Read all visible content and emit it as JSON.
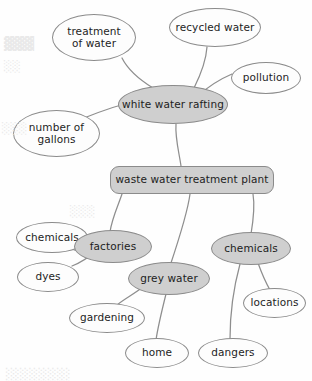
{
  "diagram": {
    "type": "concept-map",
    "canvas": {
      "width": 312,
      "height": 381
    },
    "colors": {
      "node_fill_highlight": "#cfcfcf",
      "node_fill_plain": "#fdfdfd",
      "node_stroke": "#8b8b8b",
      "edge_stroke": "#8e8e8e",
      "text": "#1d1d1d",
      "background": "#fefefe"
    },
    "nodes": [
      {
        "id": "treatment-of-water",
        "label": "treatment\nof water",
        "shape": "ellipse",
        "fill": "plain",
        "x": 52,
        "y": 14,
        "w": 84,
        "h": 47,
        "font_size": 10.5
      },
      {
        "id": "recycled-water",
        "label": "recycled water",
        "shape": "ellipse",
        "fill": "plain",
        "x": 169,
        "y": 8,
        "w": 92,
        "h": 39,
        "font_size": 10.5
      },
      {
        "id": "pollution",
        "label": "pollution",
        "shape": "ellipse",
        "fill": "plain",
        "x": 231,
        "y": 62,
        "w": 70,
        "h": 32,
        "font_size": 10.5
      },
      {
        "id": "white-water-rafting",
        "label": "white water rafting",
        "shape": "ellipse",
        "fill": "highlight",
        "x": 118,
        "y": 85,
        "w": 110,
        "h": 39,
        "font_size": 10.5
      },
      {
        "id": "number-of-gallons",
        "label": "number of\ngallons",
        "shape": "ellipse",
        "fill": "plain",
        "x": 13,
        "y": 110,
        "w": 87,
        "h": 47,
        "font_size": 10.5
      },
      {
        "id": "waste-water-treatment-plant",
        "label": "waste water treatment plant",
        "shape": "rounded",
        "fill": "highlight",
        "x": 110,
        "y": 166,
        "w": 164,
        "h": 28,
        "font_size": 10.5
      },
      {
        "id": "chemicals-left",
        "label": "chemicals",
        "shape": "ellipse",
        "fill": "plain",
        "x": 16,
        "y": 222,
        "w": 72,
        "h": 31,
        "font_size": 10.5
      },
      {
        "id": "factories",
        "label": "factories",
        "shape": "ellipse",
        "fill": "highlight",
        "x": 74,
        "y": 230,
        "w": 78,
        "h": 33,
        "font_size": 10.5
      },
      {
        "id": "chemicals-right",
        "label": "chemicals",
        "shape": "ellipse",
        "fill": "highlight",
        "x": 211,
        "y": 232,
        "w": 80,
        "h": 33,
        "font_size": 10.5
      },
      {
        "id": "dyes",
        "label": "dyes",
        "shape": "ellipse",
        "fill": "plain",
        "x": 17,
        "y": 262,
        "w": 62,
        "h": 30,
        "font_size": 10.5
      },
      {
        "id": "grey-water",
        "label": "grey water",
        "shape": "ellipse",
        "fill": "highlight",
        "x": 128,
        "y": 262,
        "w": 82,
        "h": 33,
        "font_size": 10.5
      },
      {
        "id": "locations",
        "label": "locations",
        "shape": "ellipse",
        "fill": "plain",
        "x": 243,
        "y": 288,
        "w": 63,
        "h": 30,
        "font_size": 10.5
      },
      {
        "id": "gardening",
        "label": "gardening",
        "shape": "ellipse",
        "fill": "plain",
        "x": 69,
        "y": 303,
        "w": 76,
        "h": 30,
        "font_size": 10.5
      },
      {
        "id": "home",
        "label": "home",
        "shape": "ellipse",
        "fill": "plain",
        "x": 125,
        "y": 338,
        "w": 64,
        "h": 30,
        "font_size": 10.5
      },
      {
        "id": "dangers",
        "label": "dangers",
        "shape": "ellipse",
        "fill": "plain",
        "x": 198,
        "y": 338,
        "w": 70,
        "h": 30,
        "font_size": 10.5
      }
    ],
    "edges": [
      {
        "id": "edge-treatment-to-rafting",
        "from": "treatment-of-water",
        "to": "white-water-rafting",
        "path": "M122,58 C128,70 140,80 153,88"
      },
      {
        "id": "edge-recycled-to-rafting",
        "from": "recycled-water",
        "to": "white-water-rafting",
        "path": "M207,47 C206,62 200,76 194,88"
      },
      {
        "id": "edge-pollution-to-rafting",
        "from": "pollution",
        "to": "white-water-rafting",
        "path": "M232,74 C218,80 208,87 199,95"
      },
      {
        "id": "edge-gallons-to-rafting",
        "from": "number-of-gallons",
        "to": "white-water-rafting",
        "path": "M84,118 C104,110 122,104 137,101"
      },
      {
        "id": "edge-rafting-to-plant",
        "from": "white-water-rafting",
        "to": "waste-water-treatment-plant",
        "path": "M176,124 C175,138 179,152 181,166"
      },
      {
        "id": "edge-plant-to-factories",
        "from": "waste-water-treatment-plant",
        "to": "factories",
        "path": "M122,194 C118,206 112,218 110,232"
      },
      {
        "id": "edge-plant-to-greywater",
        "from": "waste-water-treatment-plant",
        "to": "grey-water",
        "path": "M190,194 C188,210 178,242 170,266"
      },
      {
        "id": "edge-plant-to-chemicals-right",
        "from": "waste-water-treatment-plant",
        "to": "chemicals-right",
        "path": "M253,194 C255,206 253,222 251,234"
      },
      {
        "id": "edge-chemicals-left-to-factories",
        "from": "chemicals-left",
        "to": "factories",
        "path": "M74,250 C82,252 90,247 94,240"
      },
      {
        "id": "edge-dyes-to-factories",
        "from": "dyes",
        "to": "factories",
        "path": "M72,266 C82,262 90,256 94,252"
      },
      {
        "id": "edge-greywater-to-gardening",
        "from": "grey-water",
        "to": "gardening",
        "path": "M143,287 C134,294 124,299 117,305"
      },
      {
        "id": "edge-greywater-to-home",
        "from": "grey-water",
        "to": "home",
        "path": "M166,294 C162,310 158,326 156,340"
      },
      {
        "id": "edge-chemicals-right-to-locations",
        "from": "chemicals-right",
        "to": "locations",
        "path": "M258,263 C262,274 266,283 270,290"
      },
      {
        "id": "edge-chemicals-right-to-dangers",
        "from": "chemicals-right",
        "to": "dangers",
        "path": "M240,264 C234,286 230,315 230,339"
      }
    ],
    "artifacts": {
      "note": "faint reverse-side print bleed-through visible on scan",
      "marks": [
        {
          "id": "bleed-top-left",
          "text": "▓▓▓",
          "x": 4,
          "y": 36,
          "size": 13
        },
        {
          "id": "bleed-left-mid",
          "text": "░░",
          "x": 4,
          "y": 60,
          "size": 11
        },
        {
          "id": "bleed-left-lower",
          "text": "░░░",
          "x": 2,
          "y": 122,
          "size": 11
        },
        {
          "id": "bleed-mid-box",
          "text": "░░░",
          "x": 70,
          "y": 205,
          "size": 11
        },
        {
          "id": "bleed-bottom-band",
          "text": "░░░░░░░",
          "x": 6,
          "y": 368,
          "size": 12
        }
      ]
    }
  }
}
